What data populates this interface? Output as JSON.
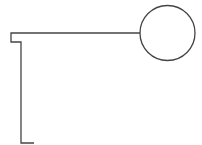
{
  "diagram": {
    "width": 202,
    "height": 145,
    "background": "#ffffff",
    "stroke_color": "#444444",
    "stroke_width": 1.3,
    "shapes": [
      {
        "id": "bracket-path",
        "type": "polyline",
        "points": [
          [
            140,
            33
          ],
          [
            11,
            33
          ],
          [
            11,
            42
          ],
          [
            21,
            42
          ],
          [
            21,
            143
          ],
          [
            34,
            143
          ]
        ]
      },
      {
        "id": "circle-node",
        "type": "circle",
        "cx": 167.5,
        "cy": 33,
        "r": 27.5
      }
    ]
  }
}
